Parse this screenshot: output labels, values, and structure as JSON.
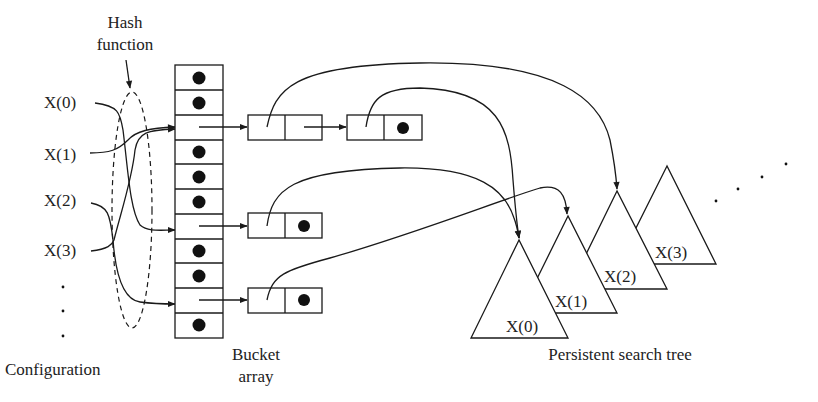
{
  "diagram": {
    "labels": {
      "hash_function_line1": "Hash",
      "hash_function_line2": "function",
      "configuration": "Configuration",
      "bucket_array_line1": "Bucket",
      "bucket_array_line2": "array",
      "persistent_search_tree": "Persistent search tree"
    },
    "configuration_items": [
      "X(0)",
      "X(1)",
      "X(2)",
      "X(3)"
    ],
    "bucket_array": {
      "cell_count": 11,
      "cells": [
        "dot",
        "dot",
        "pointer",
        "dot",
        "dot",
        "dot",
        "pointer",
        "dot",
        "dot",
        "pointer",
        "dot"
      ]
    },
    "trees": [
      "X(0)",
      "X(1)",
      "X(2)",
      "X(3)"
    ],
    "colors": {
      "line": "#1a1a1a",
      "background": "#ffffff"
    }
  }
}
